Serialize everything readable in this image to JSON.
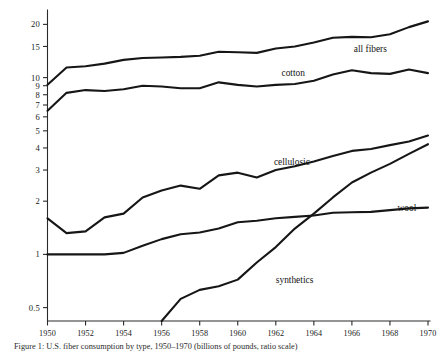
{
  "chart_data": {
    "type": "line",
    "title": "",
    "subtitle": "",
    "xlabel": "",
    "ylabel": "",
    "yscale": "log",
    "grid": false,
    "legend_position": "inline-right",
    "xlim": [
      1950,
      1970
    ],
    "ylim": [
      0.42,
      23.5
    ],
    "x": [
      1950,
      1951,
      1952,
      1953,
      1954,
      1955,
      1956,
      1957,
      1958,
      1959,
      1960,
      1961,
      1962,
      1963,
      1964,
      1965,
      1966,
      1967,
      1968,
      1969,
      1970
    ],
    "xticks": [
      1950,
      1952,
      1954,
      1956,
      1958,
      1960,
      1962,
      1964,
      1966,
      1968,
      1970
    ],
    "xtick_labels": [
      "1950",
      "1952",
      "1954",
      "1956",
      "1958",
      "1960",
      "1962",
      "1964",
      "1966",
      "1968",
      "1970"
    ],
    "yticks": [
      0.5,
      1,
      2,
      3,
      4,
      5,
      6,
      7,
      8,
      9,
      10,
      15,
      20
    ],
    "ytick_labels": [
      "0.5",
      "1",
      "2",
      "3",
      "4",
      "5",
      "6",
      "7",
      "8",
      "9",
      "10",
      "15",
      "20"
    ],
    "series": [
      {
        "name": "all fibers",
        "label": "all fibers",
        "label_x": 1966.1,
        "label_y": 14.6,
        "values": [
          9.1,
          11.4,
          11.6,
          12.0,
          12.6,
          12.9,
          13.0,
          13.1,
          13.3,
          14.0,
          13.9,
          13.8,
          14.6,
          15.0,
          15.8,
          16.8,
          17.0,
          16.9,
          17.6,
          19.3,
          20.8
        ]
      },
      {
        "name": "cotton",
        "label": "cotton",
        "label_x": 1962.3,
        "label_y": 10.6,
        "values": [
          6.5,
          8.2,
          8.5,
          8.4,
          8.6,
          9.0,
          8.9,
          8.7,
          8.7,
          9.4,
          9.1,
          8.9,
          9.1,
          9.2,
          9.6,
          10.4,
          11.0,
          10.6,
          10.5,
          11.1,
          10.6
        ]
      },
      {
        "name": "cellulosic",
        "label": "cellulosic",
        "label_x": 1961.9,
        "label_y": 3.35,
        "values": [
          1.6,
          1.32,
          1.35,
          1.62,
          1.7,
          2.1,
          2.3,
          2.45,
          2.35,
          2.8,
          2.9,
          2.72,
          3.0,
          3.15,
          3.35,
          3.6,
          3.85,
          3.95,
          4.15,
          4.35,
          4.7
        ]
      },
      {
        "name": "wool",
        "label": "wool",
        "label_x": 1968.4,
        "label_y": 1.83,
        "values": [
          1.0,
          1.0,
          1.0,
          1.0,
          1.02,
          1.12,
          1.22,
          1.3,
          1.33,
          1.4,
          1.52,
          1.55,
          1.6,
          1.63,
          1.66,
          1.72,
          1.73,
          1.74,
          1.78,
          1.82,
          1.84
        ]
      },
      {
        "name": "synthetics",
        "label": "synthetics",
        "label_x": 1962.0,
        "label_y": 0.72,
        "values": [
          null,
          null,
          null,
          null,
          null,
          null,
          0.42,
          0.56,
          0.63,
          0.66,
          0.72,
          0.9,
          1.1,
          1.4,
          1.7,
          2.1,
          2.55,
          2.9,
          3.25,
          3.7,
          4.2
        ]
      }
    ]
  },
  "caption": {
    "text": "Figure 1: U.S. fiber consumption by type, 1950–1970 (billions of pounds, ratio scale)"
  }
}
